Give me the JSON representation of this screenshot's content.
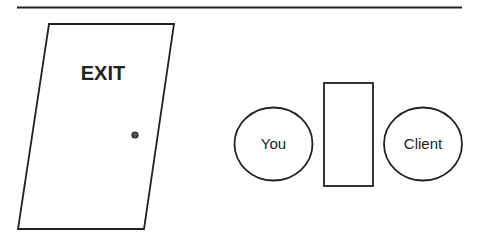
{
  "diagram": {
    "top_wall": {
      "x1": 17,
      "y1": 7.5,
      "x2": 462,
      "y2": 7.5
    },
    "door": {
      "label": "EXIT",
      "points": "49,24 174,24 144,229 18,229",
      "knob": {
        "cx": 135,
        "cy": 135,
        "r": 3
      }
    },
    "you": {
      "label": "You",
      "cx": 273.5,
      "cy": 144,
      "rx": 39,
      "ry": 36.5
    },
    "desk": {
      "x": 324,
      "y": 83,
      "width": 49,
      "height": 103
    },
    "client": {
      "label": "Client",
      "cx": 423,
      "cy": 144,
      "rx": 39,
      "ry": 36.5
    },
    "colors": {
      "stroke": "#222222",
      "background": "#ffffff",
      "knob_fill": "#555555"
    }
  }
}
